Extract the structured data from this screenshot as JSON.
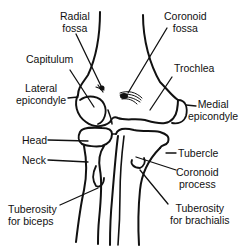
{
  "diagram": {
    "colors": {
      "ink": "#111111",
      "background": "#ffffff"
    },
    "labels": {
      "radial_fossa": {
        "line1": "Radial",
        "line2": "fossa"
      },
      "coronoid_fossa": {
        "line1": "Coronoid",
        "line2": "fossa"
      },
      "capitulum": {
        "line1": "Capitulum"
      },
      "trochlea": {
        "line1": "Trochlea"
      },
      "lateral_epicondyle": {
        "line1": "Lateral",
        "line2": "epicondyle"
      },
      "medial_epicondyle": {
        "line1": "Medial",
        "line2": "epicondyle"
      },
      "head": {
        "line1": "Head"
      },
      "neck": {
        "line1": "Neck"
      },
      "tuberosity_biceps": {
        "line1": "Tuberosity",
        "line2": "for biceps"
      },
      "tubercle": {
        "line1": "Tubercle"
      },
      "coronoid_process": {
        "line1": "Coronoid",
        "line2": "process"
      },
      "tuberosity_brachialis": {
        "line1": "Tuberosity",
        "line2": "for brachialis"
      }
    }
  }
}
